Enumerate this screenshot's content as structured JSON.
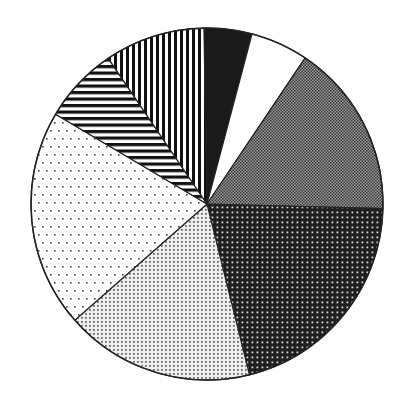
{
  "chart_data": {
    "type": "pie",
    "title": "",
    "xlabel": "",
    "ylabel": "",
    "legend": [],
    "center": [
      207,
      204
    ],
    "radius": 176,
    "start_angle_deg": -1,
    "direction": "clockwise",
    "slices": [
      {
        "pattern": "solid-black",
        "value": 4.4
      },
      {
        "pattern": "solid-white",
        "value": 5.3
      },
      {
        "pattern": "gray-checker",
        "value": 16.0
      },
      {
        "pattern": "dark-dots",
        "value": 20.7
      },
      {
        "pattern": "light-dense-dots",
        "value": 17.4
      },
      {
        "pattern": "sparse-dots",
        "value": 20.0
      },
      {
        "pattern": "horizontal-stripes",
        "value": 7.0
      },
      {
        "pattern": "vertical-stripes",
        "value": 9.2
      }
    ]
  }
}
